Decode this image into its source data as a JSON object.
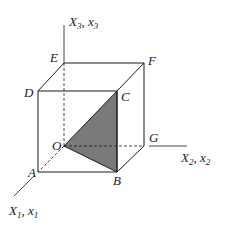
{
  "diagram": {
    "type": "cube-with-coordinate-axes",
    "colors": {
      "line": "#1a1a1a",
      "shaded_triangle": "#7a7a7a",
      "background": "#ffffff"
    },
    "axes": {
      "x1": {
        "label": "X",
        "label_sub": "1",
        "label2": "x",
        "label2_sub": "1"
      },
      "x2": {
        "label": "X",
        "label_sub": "2",
        "label2": "x",
        "label2_sub": "2"
      },
      "x3": {
        "label": "X",
        "label_sub": "3",
        "label2": "x",
        "label2_sub": "3"
      }
    },
    "vertices": {
      "A": "A",
      "B": "B",
      "C": "C",
      "D": "D",
      "E": "E",
      "F": "F",
      "G": "G",
      "O": "O"
    },
    "shaded_face": "O-B-C"
  }
}
